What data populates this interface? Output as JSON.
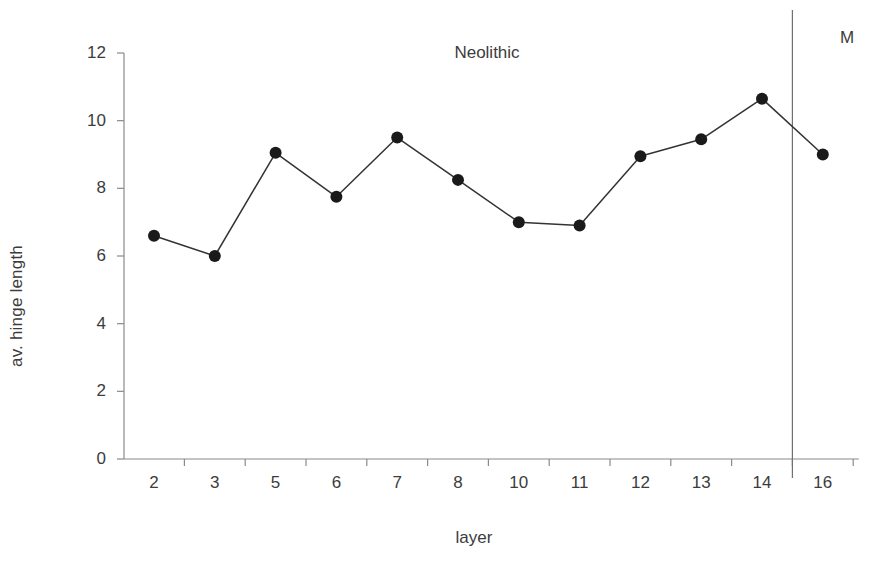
{
  "chart_data": {
    "type": "line",
    "title": "",
    "xlabel": "layer",
    "ylabel": "av. hinge length",
    "categories": [
      "2",
      "3",
      "5",
      "6",
      "7",
      "8",
      "10",
      "11",
      "12",
      "13",
      "14",
      "16"
    ],
    "values": [
      6.6,
      6.0,
      9.05,
      7.75,
      9.5,
      8.25,
      7.0,
      6.9,
      8.95,
      9.45,
      10.65,
      9.0
    ],
    "series": [
      {
        "name": "av. hinge length",
        "values": [
          6.6,
          6.0,
          9.05,
          7.75,
          9.5,
          8.25,
          7.0,
          6.9,
          8.95,
          9.45,
          10.65,
          9.0
        ]
      }
    ],
    "ylim": [
      0,
      12
    ],
    "ytick_labels": [
      "0",
      "2",
      "4",
      "6",
      "8",
      "10",
      "12"
    ],
    "ytick_values": [
      0,
      2,
      4,
      6,
      8,
      10,
      12
    ],
    "grid": false,
    "legend": "none",
    "annotations": [
      {
        "text": "Neolithic",
        "region": "left",
        "spans_categories": [
          "2",
          "14"
        ]
      },
      {
        "text": "M",
        "region": "right",
        "spans_categories": [
          "16"
        ]
      }
    ],
    "divider": {
      "after_category": "14",
      "label_left": "Neolithic",
      "label_right": "M"
    },
    "marker": "filled-circle",
    "line_color": "#333333",
    "marker_color": "#1a1a1a",
    "axis_color": "#8a8a8a",
    "text_color": "#3c3c3c",
    "background": "#ffffff"
  },
  "labels": {
    "y_axis_title": "av. hinge length",
    "x_axis_title": "layer",
    "neolithic": "Neolithic",
    "mesolithic": "M"
  }
}
